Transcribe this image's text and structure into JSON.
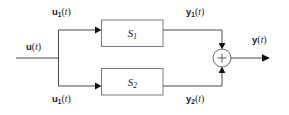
{
  "figure": {
    "type": "block-diagram",
    "background_color": "#ffffff",
    "line_color": "#4a4a4a",
    "text_color": "#1a1a1a"
  },
  "signals": {
    "input": {
      "var": "u",
      "subscript": "",
      "arg": "t",
      "full": "u(t)"
    },
    "branch_upper": {
      "var": "u",
      "subscript": "1",
      "arg": "t",
      "full": "u1(t)"
    },
    "branch_lower": {
      "var": "u",
      "subscript": "1",
      "arg": "t",
      "full": "u1(t)"
    },
    "output_upper": {
      "var": "y",
      "subscript": "1",
      "arg": "t",
      "full": "y1(t)"
    },
    "output_lower": {
      "var": "y",
      "subscript": "2",
      "arg": "t",
      "full": "y2(t)"
    },
    "output": {
      "var": "y",
      "subscript": "",
      "arg": "t",
      "full": "y(t)"
    }
  },
  "blocks": [
    {
      "id": "upper",
      "var": "S",
      "subscript": "1",
      "full": "S1"
    },
    {
      "id": "lower",
      "var": "S",
      "subscript": "2",
      "full": "S2"
    }
  ],
  "junction": {
    "operator": "+",
    "shape": "circle"
  }
}
